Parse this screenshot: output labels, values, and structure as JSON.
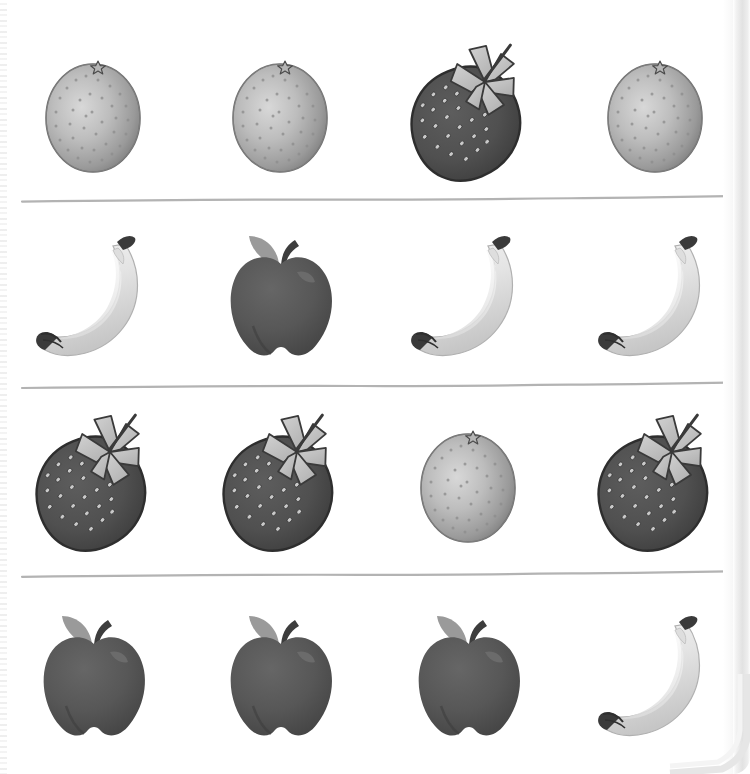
{
  "page": {
    "background_color": "#ffffff",
    "width": 750,
    "height": 774,
    "scan_edge_color": "#e2e2e2"
  },
  "divider": {
    "name": "row-divider-line",
    "color": "#b3b3b3",
    "stroke_width": 2.2,
    "count": 3,
    "y_positions": [
      200,
      385,
      576
    ]
  },
  "palette": {
    "orange_body_light": "#cfcfcf",
    "orange_body_mid": "#a8a8a8",
    "orange_body_dark": "#7d7d7d",
    "orange_outline": "#6e6e6e",
    "orange_pore": "#8a8a8a",
    "strawberry_body": "#545454",
    "strawberry_body_dark": "#3f3f3f",
    "strawberry_outline": "#2e2e2e",
    "strawberry_seed": "#c9c9c9",
    "strawberry_leaf": "#c3c3c3",
    "strawberry_leaf_dark": "#a5a5a5",
    "banana_body_light": "#ececec",
    "banana_body_mid": "#d6d6d6",
    "banana_body_dark": "#bdbdbd",
    "banana_tip": "#3a3a3a",
    "apple_body": "#5b5b5b",
    "apple_body_dark": "#454545",
    "apple_highlight": "#6e6e6e",
    "apple_leaf": "#9a9a9a",
    "apple_stem": "#3d3d3d"
  },
  "rows": [
    {
      "index": 1,
      "name": "fruit-row-1",
      "top": 30,
      "height": 165,
      "items": [
        {
          "fruit": "orange",
          "label": "Orange",
          "icon": "orange-icon"
        },
        {
          "fruit": "orange",
          "label": "Orange",
          "icon": "orange-icon"
        },
        {
          "fruit": "strawberry",
          "label": "Strawberry",
          "icon": "strawberry-icon"
        },
        {
          "fruit": "orange",
          "label": "Orange",
          "icon": "orange-icon"
        }
      ]
    },
    {
      "index": 2,
      "name": "fruit-row-2",
      "top": 210,
      "height": 170,
      "items": [
        {
          "fruit": "banana",
          "label": "Banana",
          "icon": "banana-icon"
        },
        {
          "fruit": "apple",
          "label": "Apple",
          "icon": "apple-icon"
        },
        {
          "fruit": "banana",
          "label": "Banana",
          "icon": "banana-icon"
        },
        {
          "fruit": "banana",
          "label": "Banana",
          "icon": "banana-icon"
        }
      ]
    },
    {
      "index": 3,
      "name": "fruit-row-3",
      "top": 398,
      "height": 170,
      "items": [
        {
          "fruit": "strawberry",
          "label": "Strawberry",
          "icon": "strawberry-icon"
        },
        {
          "fruit": "strawberry",
          "label": "Strawberry",
          "icon": "strawberry-icon"
        },
        {
          "fruit": "orange",
          "label": "Orange",
          "icon": "orange-icon"
        },
        {
          "fruit": "strawberry",
          "label": "Strawberry",
          "icon": "strawberry-icon"
        }
      ]
    },
    {
      "index": 4,
      "name": "fruit-row-4",
      "top": 590,
      "height": 170,
      "items": [
        {
          "fruit": "apple",
          "label": "Apple",
          "icon": "apple-icon"
        },
        {
          "fruit": "apple",
          "label": "Apple",
          "icon": "apple-icon"
        },
        {
          "fruit": "apple",
          "label": "Apple",
          "icon": "apple-icon"
        },
        {
          "fruit": "banana",
          "label": "Banana",
          "icon": "banana-icon"
        }
      ]
    }
  ]
}
